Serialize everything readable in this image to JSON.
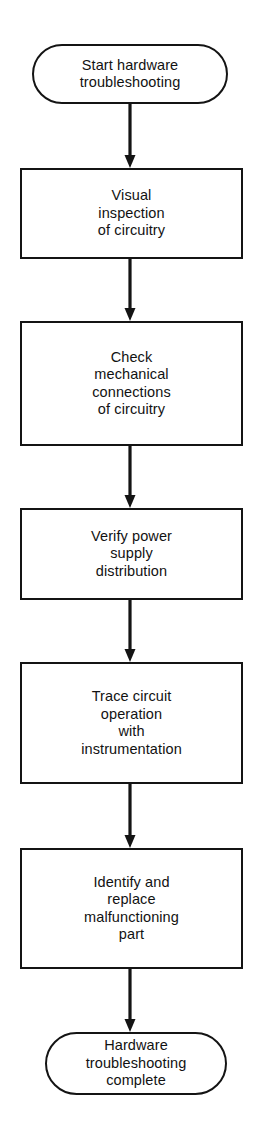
{
  "diagram": {
    "orientation": "vertical-top-to-bottom",
    "stroke_color": "#141414",
    "background_color": "#ffffff",
    "text_color": "#121212",
    "nodes": [
      {
        "id": "start",
        "shape": "terminator",
        "label": "Start hardware\ntroubleshooting",
        "lines": [
          "Start hardware",
          "troubleshooting"
        ],
        "x": 32,
        "y": 44,
        "width": 196,
        "height": 60
      },
      {
        "id": "visual-inspection",
        "shape": "process",
        "label": "Visual\ninspection\nof circuitry",
        "lines": [
          "Visual",
          "inspection",
          "of circuitry"
        ],
        "x": 20,
        "y": 168,
        "width": 223,
        "height": 91
      },
      {
        "id": "check-mechanical-connections",
        "shape": "process",
        "label": "Check\nmechanical\nconnections\nof circuitry",
        "lines": [
          "Check",
          "mechanical",
          "connections",
          "of circuitry"
        ],
        "x": 20,
        "y": 321,
        "width": 223,
        "height": 125
      },
      {
        "id": "verify-power-supply",
        "shape": "process",
        "label": "Verify power\nsupply\ndistribution",
        "lines": [
          "Verify power",
          "supply",
          "distribution"
        ],
        "x": 20,
        "y": 508,
        "width": 223,
        "height": 92
      },
      {
        "id": "trace-circuit-operation",
        "shape": "process",
        "label": "Trace circuit\noperation\nwith\ninstrumentation",
        "lines": [
          "Trace circuit",
          "operation",
          "with",
          "instrumentation"
        ],
        "x": 20,
        "y": 662,
        "width": 223,
        "height": 122
      },
      {
        "id": "identify-replace-part",
        "shape": "process",
        "label": "Identify and\nreplace\nmalfunctioning\npart",
        "lines": [
          "Identify and",
          "replace",
          "malfunctioning",
          "part"
        ],
        "x": 20,
        "y": 848,
        "width": 223,
        "height": 121
      },
      {
        "id": "end",
        "shape": "terminator",
        "label": "Hardware\ntroubleshooting\ncomplete",
        "lines": [
          "Hardware",
          "troubleshooting",
          "complete"
        ],
        "x": 45,
        "y": 1032,
        "width": 182,
        "height": 63
      }
    ],
    "connectors": [
      {
        "id": "start-to-visual-inspection",
        "from": "start",
        "to": "visual-inspection",
        "arrow": "down",
        "x": 119,
        "y": 104,
        "height": 64
      },
      {
        "id": "visual-inspection-to-check-mechanical-connections",
        "from": "visual-inspection",
        "to": "check-mechanical-connections",
        "arrow": "down",
        "x": 119,
        "y": 259,
        "height": 62
      },
      {
        "id": "check-mechanical-connections-to-verify-power-supply",
        "from": "check-mechanical-connections",
        "to": "verify-power-supply",
        "arrow": "down",
        "x": 119,
        "y": 446,
        "height": 62
      },
      {
        "id": "verify-power-supply-to-trace-circuit-operation",
        "from": "verify-power-supply",
        "to": "trace-circuit-operation",
        "arrow": "down",
        "x": 119,
        "y": 600,
        "height": 62
      },
      {
        "id": "trace-circuit-operation-to-identify-replace-part",
        "from": "trace-circuit-operation",
        "to": "identify-replace-part",
        "arrow": "down",
        "x": 119,
        "y": 784,
        "height": 64
      },
      {
        "id": "identify-replace-part-to-end",
        "from": "identify-replace-part",
        "to": "end",
        "arrow": "down",
        "x": 119,
        "y": 969,
        "height": 63
      }
    ]
  }
}
